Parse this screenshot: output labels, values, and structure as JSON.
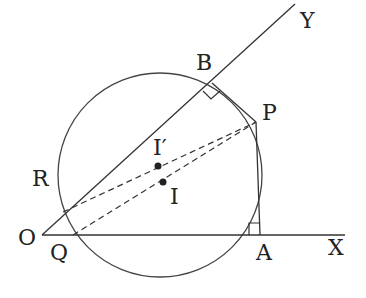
{
  "diagram": {
    "type": "geometry",
    "colors": {
      "stroke": "#333333",
      "text": "#222222",
      "background": "#ffffff"
    },
    "labels": {
      "O": "O",
      "Q": "Q",
      "A": "A",
      "X": "X",
      "R": "R",
      "B": "B",
      "Y": "Y",
      "P": "P",
      "I": "I",
      "I_prime": "I′"
    },
    "points": {
      "O": [
        42,
        235
      ],
      "Q": [
        73,
        235
      ],
      "A": [
        260,
        235
      ],
      "X": [
        345,
        235
      ],
      "R": [
        63,
        212
      ],
      "B": [
        212,
        83
      ],
      "Y": [
        295,
        4
      ],
      "P": [
        256,
        122
      ],
      "I": [
        163,
        182
      ],
      "I_prime": [
        158,
        166
      ]
    },
    "circle": {
      "cx": 160,
      "cy": 175,
      "r": 102
    },
    "right_angles": [
      "B",
      "A"
    ],
    "dashed_segments": [
      [
        "R",
        "P"
      ],
      [
        "Q",
        "P"
      ]
    ],
    "solid_segments": [
      [
        "O",
        "X"
      ],
      [
        "O",
        "Y"
      ],
      [
        "B",
        "P"
      ],
      [
        "P",
        "A"
      ]
    ]
  }
}
